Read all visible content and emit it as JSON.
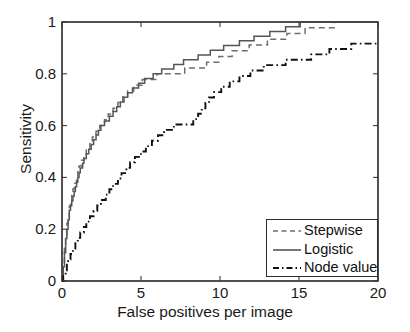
{
  "chart_data": {
    "type": "line",
    "title": "",
    "xlabel": "False positives per image",
    "ylabel": "Sensitivity",
    "xlim": [
      0,
      20
    ],
    "ylim": [
      0,
      1
    ],
    "xticks": [
      0,
      5,
      10,
      15,
      20
    ],
    "xticklabels": [
      "0",
      "5",
      "10",
      "15",
      "20"
    ],
    "yticks": [
      0,
      0.2,
      0.4,
      0.6,
      0.8,
      1
    ],
    "yticklabels": [
      "0",
      "0.2",
      "0.4",
      "0.6",
      "0.8",
      "1"
    ],
    "grid": false,
    "legend_position": "lower right",
    "series": [
      {
        "name": "Stepwise",
        "style": "dashed",
        "color": "#6e6e6e",
        "x": [
          0,
          0.1,
          0.2,
          0.35,
          0.5,
          0.7,
          0.9,
          1.1,
          1.3,
          1.6,
          1.9,
          2.2,
          2.5,
          2.9,
          3.3,
          3.7,
          4.1,
          4.5,
          5.0,
          5.5,
          6.0,
          6.5,
          7.0,
          7.6,
          8.2,
          8.8,
          9.5,
          10.2,
          11.0,
          11.8,
          12.6,
          13.4,
          14.2,
          15.0,
          15.8,
          16.6,
          17.4,
          18.2,
          19.0,
          20.0
        ],
        "y": [
          0.0,
          0.09,
          0.16,
          0.24,
          0.3,
          0.35,
          0.4,
          0.44,
          0.47,
          0.51,
          0.545,
          0.575,
          0.6,
          0.635,
          0.665,
          0.695,
          0.72,
          0.745,
          0.765,
          0.78,
          0.79,
          0.8,
          0.805,
          0.81,
          0.815,
          0.825,
          0.845,
          0.865,
          0.885,
          0.9,
          0.915,
          0.93,
          0.945,
          0.96,
          0.975,
          0.985,
          0.99,
          0.995,
          0.998,
          1.0
        ]
      },
      {
        "name": "Logistic",
        "style": "solid",
        "color": "#555555",
        "x": [
          0,
          0.1,
          0.2,
          0.35,
          0.5,
          0.7,
          0.9,
          1.1,
          1.3,
          1.6,
          1.9,
          2.2,
          2.5,
          2.9,
          3.3,
          3.7,
          4.1,
          4.5,
          5.0,
          5.5,
          6.0,
          6.5,
          7.0,
          7.6,
          8.2,
          8.8,
          9.5,
          10.2,
          11.0,
          11.8,
          12.6,
          13.4,
          14.2,
          15.0,
          15.8,
          16.6,
          17.4,
          18.2,
          19.0,
          20.0
        ],
        "y": [
          0.0,
          0.07,
          0.14,
          0.22,
          0.28,
          0.33,
          0.375,
          0.42,
          0.455,
          0.495,
          0.53,
          0.565,
          0.595,
          0.625,
          0.655,
          0.685,
          0.715,
          0.74,
          0.765,
          0.785,
          0.8,
          0.815,
          0.825,
          0.845,
          0.855,
          0.87,
          0.885,
          0.9,
          0.915,
          0.93,
          0.945,
          0.96,
          0.975,
          0.99,
          1.0,
          1.0,
          1.0,
          1.0,
          1.0,
          1.0
        ]
      },
      {
        "name": "Node value",
        "style": "dashdot",
        "color": "#111111",
        "x": [
          0,
          0.15,
          0.35,
          0.6,
          0.9,
          1.3,
          1.7,
          2.1,
          2.6,
          3.1,
          3.6,
          4.1,
          4.7,
          5.3,
          5.9,
          6.5,
          7.1,
          7.7,
          8.3,
          8.9,
          9.5,
          10.2,
          11.0,
          11.8,
          12.6,
          13.4,
          14.2,
          15.0,
          15.8,
          16.6,
          17.4,
          18.2,
          19.0,
          20.0
        ],
        "y": [
          0.0,
          0.03,
          0.07,
          0.11,
          0.15,
          0.195,
          0.235,
          0.275,
          0.315,
          0.355,
          0.395,
          0.435,
          0.475,
          0.51,
          0.545,
          0.575,
          0.595,
          0.605,
          0.615,
          0.665,
          0.715,
          0.745,
          0.775,
          0.8,
          0.82,
          0.835,
          0.845,
          0.855,
          0.865,
          0.88,
          0.895,
          0.905,
          0.915,
          0.925
        ]
      }
    ]
  },
  "legend": {
    "items": [
      {
        "label": "Stepwise"
      },
      {
        "label": "Logistic"
      },
      {
        "label": "Node value"
      }
    ]
  }
}
